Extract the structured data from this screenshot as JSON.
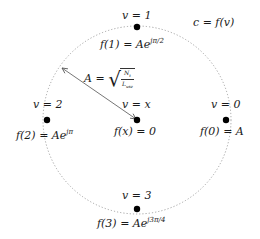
{
  "diagram": {
    "title_label": "c = f(v)",
    "circle": {
      "cx": 137,
      "cy": 120,
      "r": 94,
      "stroke": "#999999",
      "style": "dotted"
    },
    "nodes": [
      {
        "id": "v1",
        "v_label": "v = 1",
        "f_label_base": "f(1) = Ae",
        "f_label_exp": "jπ/2",
        "x": 137,
        "y": 27
      },
      {
        "id": "v2",
        "v_label": "v = 2",
        "f_label_base": "f(2) = Ae",
        "f_label_exp": "jπ",
        "x": 47,
        "y": 120
      },
      {
        "id": "vx",
        "v_label": "v = x",
        "f_label_base": "f(x) = 0",
        "f_label_exp": "",
        "x": 137,
        "y": 120
      },
      {
        "id": "v0",
        "v_label": "v = 0",
        "f_label_base": "f(0) = A",
        "f_label_exp": "",
        "x": 226,
        "y": 120
      },
      {
        "id": "v3",
        "v_label": "v = 3",
        "f_label_base": "f(3) = Ae",
        "f_label_exp": "j3π/4",
        "x": 137,
        "y": 209
      }
    ],
    "radius_label": {
      "lhs": "A =",
      "numerator": "N",
      "numerator_sub": "t",
      "denominator": "L",
      "denominator_sub": "use"
    },
    "arrow": {
      "from": [
        137,
        120
      ],
      "to": [
        62,
        68
      ],
      "color": "#555555"
    }
  }
}
